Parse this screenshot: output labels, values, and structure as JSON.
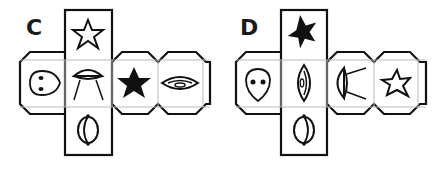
{
  "nets": [
    {
      "label": "C",
      "faces": {
        "top": "star-outline",
        "left": "alien-head",
        "center": "ufo",
        "right1": "star-filled",
        "right2": "eye-lens",
        "bottom": "planet"
      }
    },
    {
      "label": "D",
      "faces": {
        "top": "star-filled",
        "left": "alien-head",
        "center": "eye-lens-vertical",
        "right1": "ufo-sideways",
        "right2": "star-outline",
        "bottom": "planet"
      }
    }
  ],
  "colors": {
    "stroke": "#111111",
    "fold_line": "#bbbbbb",
    "background": "#ffffff"
  }
}
